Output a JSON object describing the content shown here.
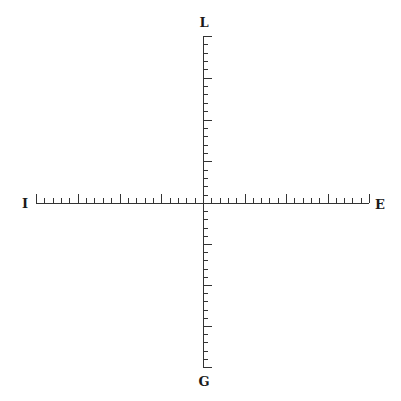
{
  "diagram": {
    "type": "coordinate-axes",
    "labels": {
      "top": "L",
      "bottom": "G",
      "left": "I",
      "right": "E"
    },
    "geometry": {
      "center": [
        203,
        203
      ],
      "left_end": 36,
      "right_end": 369,
      "top_end": 36,
      "bottom_end": 367,
      "ticks_per_half": 20,
      "major_every": 5,
      "minor_len": 5,
      "major_len": 9
    },
    "colors": {
      "axis": "#333333",
      "label": "#1a1a1a",
      "background": "#ffffff"
    }
  }
}
